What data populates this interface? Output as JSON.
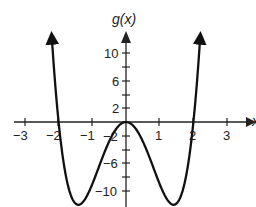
{
  "chart_data": {
    "type": "line",
    "title": "",
    "xlabel": "x",
    "ylabel": "g(x)",
    "xlim": [
      -3.3,
      3.5
    ],
    "ylim": [
      -12.3,
      13
    ],
    "x_ticks": [
      -3,
      -2,
      -1,
      1,
      2,
      3
    ],
    "x_tick_labels": [
      "-3",
      "-2",
      "-1",
      "1",
      "2",
      "3"
    ],
    "y_ticks": [
      10,
      8,
      6,
      4,
      2,
      -2,
      -4,
      -6,
      -8,
      -10
    ],
    "y_tick_labels": {
      "10": "10",
      "6": "6",
      "2": "2",
      "-2": "-2",
      "-6": "-6",
      "-10": "-10"
    },
    "grid": false,
    "series": [
      {
        "name": "g(x)",
        "function": "3x^4 - 12x^2",
        "x": [
          -2.2,
          -2.0,
          -1.8,
          -1.6,
          -1.41,
          -1.2,
          -1.0,
          -0.8,
          -0.6,
          -0.4,
          -0.2,
          0,
          0.2,
          0.4,
          0.6,
          0.8,
          1.0,
          1.2,
          1.41,
          1.6,
          1.8,
          2.0,
          2.2
        ],
        "values": [
          12.2,
          0,
          -7.4,
          -11.1,
          -12,
          -11.1,
          -9,
          -6.5,
          -3.9,
          -1.8,
          -0.5,
          0,
          -0.5,
          -1.8,
          -3.9,
          -6.5,
          -9,
          -11.1,
          -12,
          -11.1,
          -7.4,
          0,
          12.2
        ]
      }
    ],
    "annotations": [
      "zeros at x = -2, 0, 2",
      "local max (0, 0)",
      "minima near (-1.4, -12) and (1.4, -12)",
      "arrows on both ends of curve"
    ]
  },
  "labels": {
    "y_axis": "g(x)",
    "x_axis": "x",
    "x_ticks": [
      "−3",
      "−2",
      "−1",
      "1",
      "2",
      "3"
    ],
    "y_ticks": [
      "10",
      "6",
      "2",
      "−2",
      "−6",
      "−10"
    ]
  }
}
